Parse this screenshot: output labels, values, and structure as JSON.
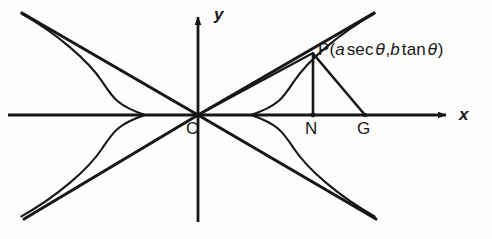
{
  "figure": {
    "kind": "hyperbola-parametric-diagram",
    "caption": "",
    "stroke_color": "#17171a",
    "background_color": "#fdfdfb"
  },
  "axes": {
    "x_label": "x",
    "y_label": "y",
    "x_axis": {
      "x1": 8,
      "y1": 115,
      "x2": 452,
      "y2": 115
    },
    "y_axis": {
      "x1": 198,
      "y1": 222,
      "x2": 198,
      "y2": 10
    },
    "origin": {
      "x": 198,
      "y": 115
    }
  },
  "points": [
    {
      "name": "C",
      "label": "C",
      "x": 198,
      "y": 115,
      "label_x": 186,
      "label_y": 120,
      "role": "center"
    },
    {
      "name": "P",
      "label": "P",
      "x": 313,
      "y": 53,
      "label_x": 318,
      "label_y": 42,
      "role": "point-on-curve"
    },
    {
      "name": "N",
      "label": "N",
      "x": 313,
      "y": 115,
      "label_x": 306,
      "label_y": 120,
      "role": "foot-of-ordinate"
    },
    {
      "name": "G",
      "label": "G",
      "x": 365,
      "y": 115,
      "label_x": 358,
      "label_y": 120,
      "role": "normal-intercept"
    }
  ],
  "p_label": {
    "prefix": "P(",
    "term1_var": "a",
    "term1_fn": "sec",
    "term1_angle": "θ",
    "separator": ",",
    "term2_var": "b",
    "term2_fn": "tan",
    "term2_angle": "θ",
    "suffix": ")",
    "full_text": "P(a sec θ, b tan θ)"
  },
  "curves": {
    "hyperbola": {
      "a": 53,
      "b": 86,
      "center": {
        "x": 198,
        "y": 115
      },
      "right_vertex": {
        "x": 251,
        "y": 115
      },
      "left_vertex": {
        "x": 145,
        "y": 115
      },
      "t_max": 1.62
    },
    "asymptotes": [
      {
        "name": "asymptote-up-right",
        "x1": 198,
        "y1": 115,
        "x2": 374,
        "y2": 13
      },
      {
        "name": "asymptote-down-right",
        "x1": 198,
        "y1": 115,
        "x2": 376,
        "y2": 219
      },
      {
        "name": "asymptote-up-left",
        "x1": 198,
        "y1": 115,
        "x2": 22,
        "y2": 13
      },
      {
        "name": "asymptote-down-left",
        "x1": 198,
        "y1": 115,
        "x2": 24,
        "y2": 219
      }
    ]
  },
  "segments": [
    {
      "name": "segment-CP",
      "x1": 198,
      "y1": 115,
      "x2": 313,
      "y2": 53
    },
    {
      "name": "segment-PN",
      "x1": 313,
      "y1": 53,
      "x2": 313,
      "y2": 115
    },
    {
      "name": "segment-PG",
      "x1": 313,
      "y1": 53,
      "x2": 365,
      "y2": 115
    }
  ]
}
